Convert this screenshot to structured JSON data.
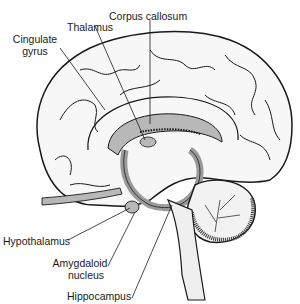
{
  "diagram": {
    "labels": {
      "cingulate_gyrus_line1": "Cingulate",
      "cingulate_gyrus_line2": "gyrus",
      "thalamus": "Thalamus",
      "corpus_callosum": "Corpus callosum",
      "hypothalamus": "Hypothalamus",
      "amygdaloid_line1": "Amygdaloid",
      "amygdaloid_line2": "nucleus",
      "hippocampus": "Hippocampus"
    },
    "colors": {
      "outline": "#1a1a1a",
      "fill_cortex": "#f7f7f7",
      "fill_limbic": "#b8b8b8",
      "fill_brainstem": "#efefef"
    }
  }
}
